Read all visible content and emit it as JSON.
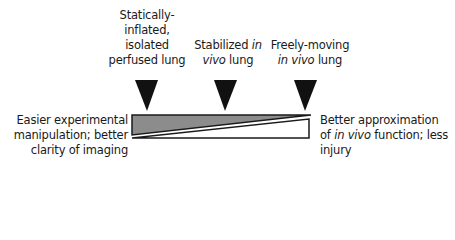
{
  "markers": [
    {
      "id": "static-isolated",
      "label_lines": [
        [
          {
            "text": "Statically-",
            "italic": false
          }
        ],
        [
          {
            "text": "inflated,",
            "italic": false
          }
        ],
        [
          {
            "text": "isolated",
            "italic": false
          }
        ],
        [
          {
            "text": "perfused lung",
            "italic": false
          }
        ]
      ]
    },
    {
      "id": "stabilized-in-vivo",
      "label_lines": [
        [
          {
            "text": "Stabilized ",
            "italic": false
          },
          {
            "text": "in",
            "italic": true
          }
        ],
        [
          {
            "text": "vivo",
            "italic": true
          },
          {
            "text": " lung",
            "italic": false
          }
        ]
      ]
    },
    {
      "id": "freely-moving-in-vivo",
      "label_lines": [
        [
          {
            "text": "Freely-moving",
            "italic": false
          }
        ],
        [
          {
            "text": "in vivo",
            "italic": true
          },
          {
            "text": " lung",
            "italic": false
          }
        ]
      ]
    }
  ],
  "left_label": {
    "line1": "Easier experimental",
    "line2": "manipulation; better",
    "line3": "clarity of imaging"
  },
  "right_label": {
    "line1": "Better approximation",
    "line2_prefix": "of ",
    "line2_italic": "in vivo",
    "line2_suffix": " function; less",
    "line3": "injury"
  },
  "colors": {
    "triangle": "#111111",
    "grey_wedge": "#8c8c8c",
    "white_wedge": "#ffffff",
    "outline": "#1a1a1a"
  }
}
